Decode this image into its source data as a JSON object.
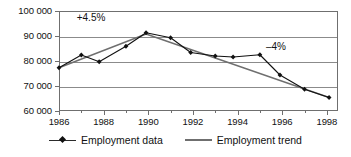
{
  "chart_data": {
    "type": "line",
    "title": "",
    "subtitle": "",
    "xlabel": "",
    "ylabel": "",
    "xlim": [
      1986,
      1998.5
    ],
    "ylim": [
      60000,
      100000
    ],
    "grid": true,
    "legend_position": "bottom-center",
    "y_ticks": [
      {
        "value": 100000,
        "label": "100 000"
      },
      {
        "value": 90000,
        "label": "90 000"
      },
      {
        "value": 80000,
        "label": "80 000"
      },
      {
        "value": 70000,
        "label": "70 000"
      },
      {
        "value": 60000,
        "label": "60 000"
      }
    ],
    "x_ticks_major": [
      {
        "value": 1986,
        "label": "1986"
      },
      {
        "value": 1988,
        "label": "1988"
      },
      {
        "value": 1990,
        "label": "1990"
      },
      {
        "value": 1992,
        "label": "1992"
      },
      {
        "value": 1994,
        "label": "1994"
      },
      {
        "value": 1996,
        "label": "1996"
      },
      {
        "value": 1998,
        "label": "1998"
      }
    ],
    "x_ticks_minor": [
      1987,
      1989,
      1991,
      1993,
      1995,
      1997
    ],
    "series": [
      {
        "name": "Employment data",
        "style": "line-with-diamond-markers",
        "color": "#111111",
        "x": [
          1986.0,
          1987.0,
          1987.8,
          1989.0,
          1989.9,
          1991.0,
          1991.9,
          1993.0,
          1993.8,
          1995.0,
          1995.9,
          1997.0,
          1998.1
        ],
        "values": [
          77300,
          82400,
          79700,
          85900,
          91300,
          89300,
          83400,
          82000,
          81600,
          82500,
          74400,
          68700,
          65400
        ]
      },
      {
        "name": "Employment trend",
        "style": "line",
        "color": "#6f6f6f",
        "x": [
          1986.0,
          1989.9,
          1998.1
        ],
        "values": [
          77300,
          90800,
          65400
        ]
      }
    ],
    "annotations": [
      {
        "name": "growth-rate",
        "text": "+4.5%",
        "x": 1987.6,
        "y": 97200
      },
      {
        "name": "decline-rate",
        "text": "–4%",
        "x": 1995.9,
        "y": 85500
      }
    ],
    "legend": [
      {
        "label": "Employment data",
        "marker": "diamond",
        "color": "#111111"
      },
      {
        "label": "Employment trend",
        "marker": "line",
        "color": "#6f6f6f"
      }
    ]
  }
}
